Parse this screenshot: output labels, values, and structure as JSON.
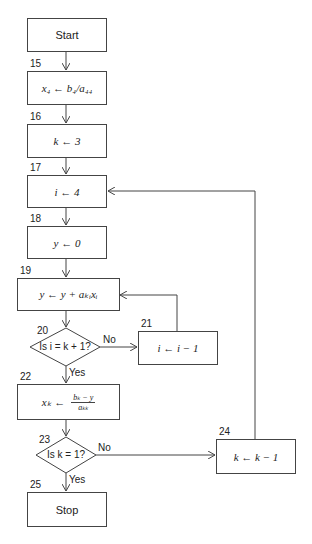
{
  "flowchart": {
    "start": {
      "label": "Start"
    },
    "steps": [
      {
        "id": "15",
        "number": "15",
        "text": "x₄ ← b₄/a₄₄"
      },
      {
        "id": "16",
        "number": "16",
        "text": "k ← 3"
      },
      {
        "id": "17",
        "number": "17",
        "text": "i ← 4"
      },
      {
        "id": "18",
        "number": "18",
        "text": "y ← 0"
      },
      {
        "id": "19",
        "number": "19",
        "text": "y ← y + aₖᵢxᵢ"
      },
      {
        "id": "20",
        "number": "20",
        "text": "Is i = k + 1?"
      },
      {
        "id": "21",
        "number": "21",
        "text": "i ← i − 1"
      },
      {
        "id": "22",
        "number": "22",
        "lhs": "xₖ ←",
        "numerator": "bₖ − y",
        "denominator": "aₖₖ"
      },
      {
        "id": "23",
        "number": "23",
        "text": "Is k = 1?"
      },
      {
        "id": "24",
        "number": "24",
        "text": "k ← k − 1"
      },
      {
        "id": "25",
        "number": "25",
        "text": "Stop"
      }
    ],
    "branch_labels": {
      "d20_no": "No",
      "d20_yes": "Yes",
      "d23_no": "No",
      "d23_yes": "Yes"
    }
  },
  "colors": {
    "line": "#444444",
    "background": "#ffffff"
  }
}
